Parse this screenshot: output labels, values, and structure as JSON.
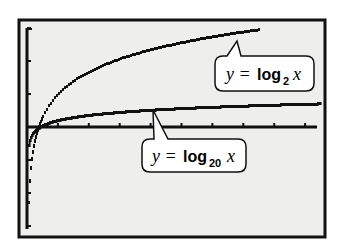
{
  "chart_data": {
    "type": "line",
    "title": "",
    "xlabel": "",
    "ylabel": "",
    "grid": false,
    "legend": "callout labels",
    "xlim": [
      -0.8,
      29
    ],
    "ylim": [
      -5,
      4.8
    ],
    "x_tick_step": 3,
    "y_tick_step": 1.5,
    "screen": {
      "left": 19,
      "top": 20,
      "right": 325,
      "bottom": 237,
      "axis_x_px": 27,
      "axis_y_px": 127,
      "px_per_x": 10.3,
      "px_per_y": 22
    },
    "series": [
      {
        "name": "y = log2 x",
        "base": 2,
        "x_start": 0.02,
        "x_end": 22.5,
        "style": "dotted-pixel"
      },
      {
        "name": "y = log20 x",
        "base": 20,
        "x_start": 0.02,
        "x_end": 28.5,
        "style": "thick-pixel"
      }
    ],
    "annotations": [
      {
        "text_prefix": "y = ",
        "func": "log",
        "subscript": "2",
        "var": "x",
        "box": [
          215,
          56,
          314,
          91
        ],
        "pointer_to": [
          237,
          41
        ]
      },
      {
        "text_prefix": "y = ",
        "func": "log",
        "subscript": "20",
        "var": "x",
        "box": [
          142,
          139,
          246,
          172
        ],
        "pointer_to": [
          153,
          110
        ]
      }
    ]
  },
  "labels": {
    "log2": {
      "prefix": "y =",
      "func": "log",
      "sub": "2",
      "var": "x"
    },
    "log20": {
      "prefix": "y =",
      "func": "log",
      "sub": "20",
      "var": "x"
    }
  },
  "colors": {
    "screen_bg": "#eeeeec",
    "ink": "#111111",
    "label_bg": "#ffffff"
  }
}
